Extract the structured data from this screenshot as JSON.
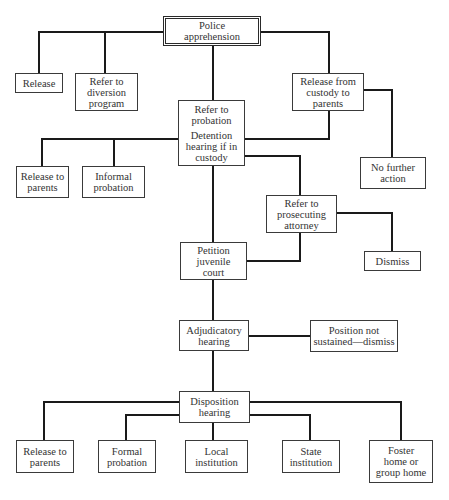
{
  "diagram": {
    "type": "flowchart",
    "nodes": {
      "police_apprehension": {
        "lines": [
          "Police",
          "apprehension"
        ]
      },
      "release": {
        "lines": [
          "Release"
        ]
      },
      "refer_diversion": {
        "lines": [
          "Refer to",
          "diversion",
          "program"
        ]
      },
      "release_custody_parents": {
        "lines": [
          "Release from",
          "custody to",
          "parents"
        ]
      },
      "refer_probation": {
        "lines": [
          "Refer to",
          "probation"
        ],
        "lines2": [
          "Detention",
          "hearing if in",
          "custody"
        ]
      },
      "release_parents_upper": {
        "lines": [
          "Release to",
          "parents"
        ]
      },
      "informal_probation": {
        "lines": [
          "Informal",
          "probation"
        ]
      },
      "no_further_action": {
        "lines": [
          "No further",
          "action"
        ]
      },
      "refer_prosecuting": {
        "lines": [
          "Refer to",
          "prosecuting",
          "attorney"
        ]
      },
      "petition_court": {
        "lines": [
          "Petition",
          "juvenile",
          "court"
        ]
      },
      "dismiss": {
        "lines": [
          "Dismiss"
        ]
      },
      "adjudicatory_hearing": {
        "lines": [
          "Adjudicatory",
          "hearing"
        ]
      },
      "position_not_sustained": {
        "lines": [
          "Position not",
          "sustained—dismiss"
        ]
      },
      "disposition_hearing": {
        "lines": [
          "Disposition",
          "hearing"
        ]
      },
      "release_parents_lower": {
        "lines": [
          "Release to",
          "parents"
        ]
      },
      "formal_probation": {
        "lines": [
          "Formal",
          "probation"
        ]
      },
      "local_institution": {
        "lines": [
          "Local",
          "institution"
        ]
      },
      "state_institution": {
        "lines": [
          "State",
          "institution"
        ]
      },
      "foster_home": {
        "lines": [
          "Foster",
          "home or",
          "group home"
        ]
      }
    },
    "edges": [
      [
        "police_apprehension",
        "release"
      ],
      [
        "police_apprehension",
        "refer_diversion"
      ],
      [
        "police_apprehension",
        "refer_probation"
      ],
      [
        "police_apprehension",
        "release_custody_parents"
      ],
      [
        "release_custody_parents",
        "refer_probation"
      ],
      [
        "release_custody_parents",
        "no_further_action"
      ],
      [
        "refer_probation",
        "release_parents_upper"
      ],
      [
        "refer_probation",
        "informal_probation"
      ],
      [
        "refer_probation",
        "refer_prosecuting"
      ],
      [
        "refer_probation",
        "petition_court"
      ],
      [
        "refer_prosecuting",
        "petition_court"
      ],
      [
        "refer_prosecuting",
        "dismiss"
      ],
      [
        "petition_court",
        "adjudicatory_hearing"
      ],
      [
        "adjudicatory_hearing",
        "position_not_sustained"
      ],
      [
        "adjudicatory_hearing",
        "disposition_hearing"
      ],
      [
        "disposition_hearing",
        "release_parents_lower"
      ],
      [
        "disposition_hearing",
        "formal_probation"
      ],
      [
        "disposition_hearing",
        "local_institution"
      ],
      [
        "disposition_hearing",
        "state_institution"
      ],
      [
        "disposition_hearing",
        "foster_home"
      ]
    ]
  }
}
